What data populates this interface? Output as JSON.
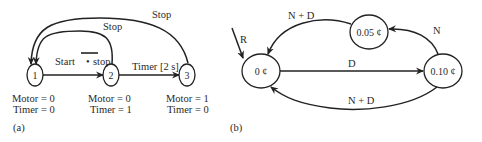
{
  "diagram_a": {
    "caption": "(a)",
    "nodes": [
      {
        "id": "1",
        "label": "1",
        "outputs": [
          "Motor = 0",
          "Timer = 0"
        ]
      },
      {
        "id": "2",
        "label": "2",
        "outputs": [
          "Motor = 0",
          "Timer = 1"
        ]
      },
      {
        "id": "3",
        "label": "3",
        "outputs": [
          "Motor = 1",
          "Timer = 0"
        ]
      }
    ],
    "edges": [
      {
        "from": "1",
        "to": "2",
        "label_start": "Start",
        "label_dot": "•",
        "label_stop": "stop",
        "label_stop_overbar": true
      },
      {
        "from": "2",
        "to": "3",
        "label": "Timer [2 s]"
      },
      {
        "from": "2",
        "to": "1",
        "label": "Stop"
      },
      {
        "from": "3",
        "to": "1",
        "label": "Stop"
      }
    ]
  },
  "diagram_b": {
    "caption": "(b)",
    "initial_label": "R",
    "nodes": [
      {
        "id": "s0",
        "label": "0 ¢"
      },
      {
        "id": "s5",
        "label": "0.05 ¢"
      },
      {
        "id": "s10",
        "label": "0.10 ¢"
      }
    ],
    "edges": [
      {
        "from": "s0",
        "to": "s10",
        "label": "D"
      },
      {
        "from": "s10",
        "to": "s5",
        "label": "N"
      },
      {
        "from": "s5",
        "to": "s0",
        "label": "N + D"
      },
      {
        "from": "s10",
        "to": "s0",
        "label": "N + D"
      }
    ]
  }
}
